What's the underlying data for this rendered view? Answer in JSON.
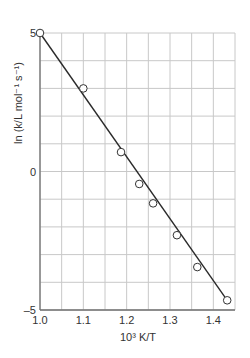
{
  "chart_data": {
    "type": "scatter",
    "title": "",
    "xlabel": "10³ K/T",
    "ylabel": "ln (k/L mol⁻¹ s⁻¹)",
    "xlim": [
      1.0,
      1.45
    ],
    "ylim": [
      -5,
      5
    ],
    "x_ticks": [
      1.0,
      1.1,
      1.2,
      1.3,
      1.4
    ],
    "x_tick_labels": [
      "1.0",
      "1.1",
      "1.2",
      "1.3",
      "1.4"
    ],
    "y_ticks": [
      -5,
      0,
      5
    ],
    "y_tick_labels": [
      "–5",
      "0",
      "5"
    ],
    "grid": true,
    "grid_x_step": 0.05,
    "grid_y_step": 1,
    "legend": null,
    "series": [
      {
        "name": "measured",
        "marker": "open-circle",
        "x": [
          1.0,
          1.1,
          1.187,
          1.229,
          1.261,
          1.316,
          1.363,
          1.432
        ],
        "y": [
          5.0,
          3.0,
          0.7,
          -0.45,
          -1.15,
          -2.3,
          -3.45,
          -4.65
        ]
      },
      {
        "name": "linear fit",
        "style": "line",
        "x": [
          1.0,
          1.432
        ],
        "y": [
          5.0,
          -4.65
        ]
      }
    ]
  },
  "colors": {
    "grid": "#c8c8c8",
    "axis": "#707070",
    "line": "#2a2a2a",
    "marker_stroke": "#333333",
    "marker_fill": "#ffffff"
  }
}
